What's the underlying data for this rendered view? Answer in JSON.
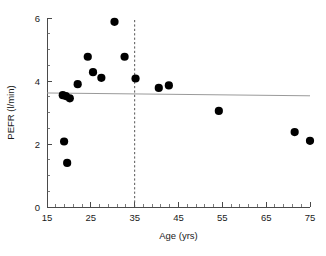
{
  "chart_data": {
    "type": "scatter",
    "title": "",
    "xlabel": "Age (yrs)",
    "ylabel": "PEFR (l/min)",
    "xlim": [
      15,
      75
    ],
    "ylim": [
      0,
      6
    ],
    "xticks": [
      15,
      25,
      35,
      45,
      55,
      65,
      75
    ],
    "xtick_labels": [
      "15",
      "25",
      "35",
      "45",
      "55",
      "65",
      "75"
    ],
    "x_minor_step": 2,
    "yticks": [
      0,
      2,
      4,
      6
    ],
    "ytick_labels": [
      "0",
      "2",
      "4",
      "6"
    ],
    "y_minor_step": 0.5,
    "grid": false,
    "legend": null,
    "points": [
      {
        "x": 18.9,
        "y": 2.08
      },
      {
        "x": 19.6,
        "y": 1.4
      },
      {
        "x": 18.6,
        "y": 3.55
      },
      {
        "x": 19.3,
        "y": 3.52
      },
      {
        "x": 20.2,
        "y": 3.45
      },
      {
        "x": 22.0,
        "y": 3.9
      },
      {
        "x": 24.3,
        "y": 4.77
      },
      {
        "x": 25.5,
        "y": 4.28
      },
      {
        "x": 27.4,
        "y": 4.1
      },
      {
        "x": 30.4,
        "y": 5.88
      },
      {
        "x": 32.7,
        "y": 4.77
      },
      {
        "x": 35.2,
        "y": 4.08
      },
      {
        "x": 40.5,
        "y": 3.78
      },
      {
        "x": 42.8,
        "y": 3.86
      },
      {
        "x": 54.2,
        "y": 3.05
      },
      {
        "x": 71.5,
        "y": 2.38
      },
      {
        "x": 75.0,
        "y": 2.1
      }
    ],
    "regression_line": {
      "x_start": 15,
      "y_start": 3.62,
      "x_end": 75,
      "y_end": 3.53,
      "color": "#9a9a9a"
    },
    "reference_line": {
      "orientation": "vertical",
      "x": 35,
      "y_start": 0,
      "y_end": 6,
      "style": "dashed",
      "color": "#555555"
    },
    "marker": {
      "shape": "circle",
      "radius_px": 4.1,
      "color": "#000000"
    }
  }
}
